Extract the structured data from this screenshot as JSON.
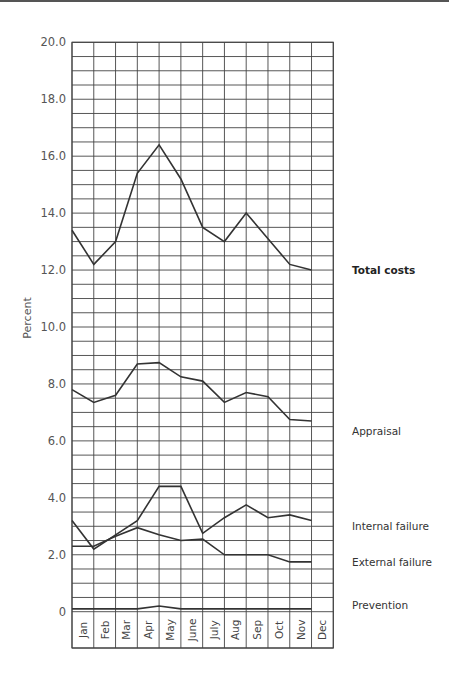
{
  "chart_data": {
    "type": "line",
    "title": "",
    "xlabel": "",
    "ylabel": "Percent",
    "ylim": [
      0,
      20
    ],
    "yticks": [
      {
        "value": 0,
        "label": "0"
      },
      {
        "value": 2,
        "label": "2.0"
      },
      {
        "value": 4,
        "label": "4.0"
      },
      {
        "value": 6,
        "label": "6.0"
      },
      {
        "value": 8,
        "label": "8.0"
      },
      {
        "value": 10,
        "label": "10.0"
      },
      {
        "value": 12,
        "label": "12.0"
      },
      {
        "value": 14,
        "label": "14.0"
      },
      {
        "value": 16,
        "label": "16.0"
      },
      {
        "value": 18,
        "label": "18.0"
      },
      {
        "value": 20,
        "label": "20.0"
      }
    ],
    "grid": true,
    "grid_step": 0.5,
    "legend_position": "right (inline labels)",
    "categories": [
      "Jan",
      "Feb",
      "Mar",
      "Apr",
      "May",
      "June",
      "July",
      "Aug",
      "Sep",
      "Oct",
      "Nov",
      "Dec"
    ],
    "series": [
      {
        "name": "Total costs",
        "bold": true,
        "label_value": 12.0,
        "values": [
          13.4,
          12.2,
          13.0,
          15.4,
          16.4,
          15.2,
          13.5,
          13.0,
          14.0,
          13.1,
          12.2,
          12.0
        ]
      },
      {
        "name": "Appraisal",
        "bold": false,
        "label_value": 6.35,
        "values": [
          7.8,
          7.35,
          7.6,
          8.7,
          8.75,
          8.25,
          8.1,
          7.35,
          7.7,
          7.55,
          6.75,
          6.7
        ]
      },
      {
        "name": "Internal failure",
        "bold": false,
        "label_value": 3.0,
        "values": [
          3.2,
          2.2,
          2.7,
          3.2,
          4.4,
          4.4,
          2.75,
          3.3,
          3.75,
          3.3,
          3.4,
          3.2
        ]
      },
      {
        "name": "External failure",
        "bold": false,
        "label_value": 1.75,
        "values": [
          2.3,
          2.3,
          2.65,
          2.95,
          2.7,
          2.5,
          2.55,
          2.0,
          2.0,
          2.0,
          1.75,
          1.75
        ]
      },
      {
        "name": "Prevention",
        "bold": false,
        "label_value": 0.25,
        "values": [
          0.1,
          0.1,
          0.1,
          0.1,
          0.2,
          0.1,
          0.1,
          0.1,
          0.1,
          0.1,
          0.1,
          0.1
        ]
      }
    ]
  },
  "colors": {
    "line": "#333333",
    "grid": "#444444",
    "text": "#555555"
  }
}
